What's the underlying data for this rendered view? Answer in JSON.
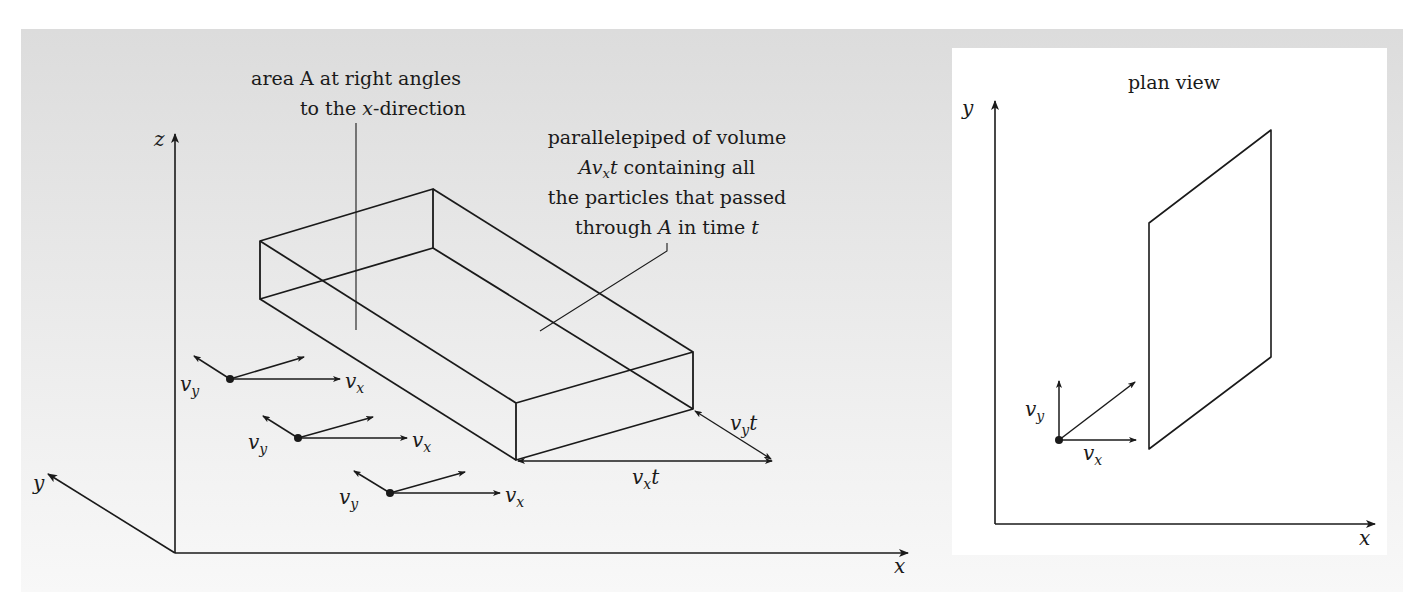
{
  "main_diagram": {
    "axes": {
      "x": "x",
      "y": "y",
      "z": "z"
    },
    "annotations": {
      "area_line1": "area A at right angles",
      "area_line2_pre": "to the ",
      "area_line2_var": "x",
      "area_line2_post": "-direction",
      "vol_line1": "parallelepiped of volume",
      "vol_line2_var": "Av",
      "vol_line2_sub": "x",
      "vol_line2_t": "t",
      "vol_line2_post": " containing all",
      "vol_line3": "the particles that passed",
      "vol_line4_pre": "through ",
      "vol_line4_var": "A",
      "vol_line4_mid": " in time ",
      "vol_line4_t": "t"
    },
    "dimensions": {
      "vyt_v": "v",
      "vyt_sub": "y",
      "vyt_t": "t",
      "vxt_v": "v",
      "vxt_sub": "x",
      "vxt_t": "t"
    },
    "particles": [
      {
        "vy_label": "v",
        "vy_sub": "y",
        "vx_label": "v",
        "vx_sub": "x"
      },
      {
        "vy_label": "v",
        "vy_sub": "y",
        "vx_label": "v",
        "vx_sub": "x"
      },
      {
        "vy_label": "v",
        "vy_sub": "y",
        "vx_label": "v",
        "vx_sub": "x"
      }
    ]
  },
  "plan_view": {
    "title": "plan view",
    "axes": {
      "x": "x",
      "y": "y"
    },
    "particle": {
      "vy_label": "v",
      "vy_sub": "y",
      "vx_label": "v",
      "vx_sub": "x"
    }
  },
  "colors": {
    "ink": "#1a1a1a",
    "panel_top": "#dcdcdc",
    "panel_bottom": "#f8f8f8",
    "plan_bg": "#ffffff"
  }
}
